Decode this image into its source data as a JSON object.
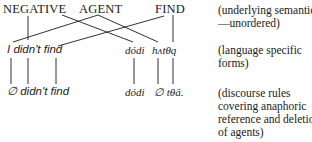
{
  "semantics": {
    "negative": "NEGATIVE",
    "agent": "AGENT",
    "find": "FIND"
  },
  "language_forms": {
    "english": "I didn't find",
    "native_1": "dódi",
    "native_2": "hʌtθq"
  },
  "discourse_forms": {
    "english": "∅ didn't find",
    "native_1": "dódi",
    "native_2": "∅ tθä."
  },
  "annotations": {
    "semantics_line1": "(underlying semantics",
    "semantics_line2": "—unordered)",
    "forms_line1": "(language specific",
    "forms_line2": "forms)",
    "discourse_line1": "(discourse rules",
    "discourse_line2": "covering anaphoric",
    "discourse_line3": "reference and deletion",
    "discourse_line4": "of agents)"
  },
  "colors": {
    "ink": "#1a1a1a",
    "background": "#ffffff"
  }
}
